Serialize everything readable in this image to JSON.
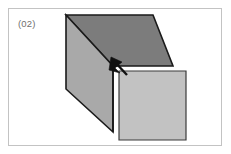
{
  "figure": {
    "label": "(02)",
    "panel": {
      "background_color": "#ffffff",
      "border_color": "#c3c3c3"
    },
    "label_color": "#6f6f6f",
    "diagram_type": "3d-open-box-isometric",
    "annotation": {
      "kind": "arrow",
      "icon": "arrow-up-left-icon",
      "direction": "up-left",
      "color": "#111111",
      "target": "inner-corner-vertex",
      "tip_x": 104,
      "tip_y": 50,
      "tail_x": 117,
      "tail_y": 64
    },
    "faces": [
      {
        "name": "top-face",
        "fill_color": "#7c7c7c",
        "stroke_color": "#1a1a1a",
        "points": "57,6 144,6 164,57 104,57"
      },
      {
        "name": "left-face",
        "fill_color": "#a9a9a9",
        "stroke_color": "#1a1a1a",
        "points": "57,6 104,57 104,123 57,80"
      },
      {
        "name": "right-square-face",
        "fill_color": "#c2c2c2",
        "stroke_color": "#2b2b2b",
        "points": "110,62 177,62 177,131 110,131"
      }
    ]
  }
}
